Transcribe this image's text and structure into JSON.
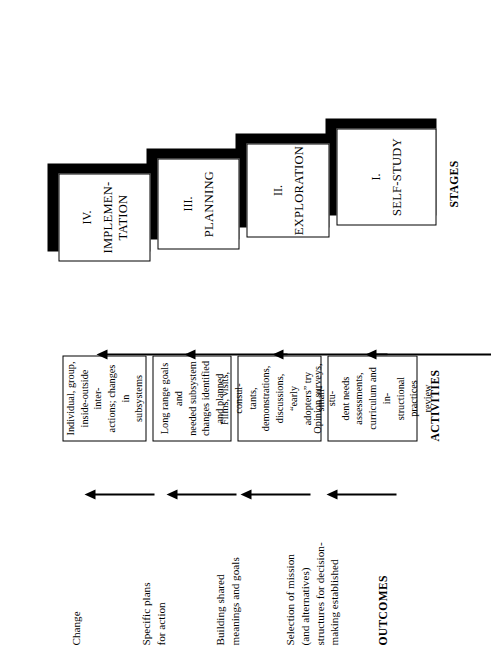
{
  "diagram": {
    "orientation": "rotated-90-ccw",
    "columns": {
      "stages_label": "STAGES",
      "activities_label": "ACTIVITIES",
      "outcomes_label": "OUTCOMES"
    },
    "colors": {
      "ink": "#000000",
      "paper": "#ffffff"
    },
    "rows": [
      {
        "id": "self-study",
        "stage_number": "I.",
        "stage_name": "SELF-STUDY",
        "activities": "Opinion surveys, stu-\ndent needs assessments,\ncurriculum and in-\nstructional practices\nreview",
        "outcome": "Selection of mission\n(and alternatives)\nstructures for decision-\nmaking established"
      },
      {
        "id": "exploration",
        "stage_number": "II.",
        "stage_name": "EXPLORATION",
        "activities": "Films, visits, consul-\ntants, demonstrations,\ndiscussions, “early\nadopters” try small-\nscale innovations",
        "outcome": "Building shared\nmeanings and goals"
      },
      {
        "id": "planning",
        "stage_number": "III.",
        "stage_name": "PLANNING",
        "activities": "Long range goals and\nneeded subsystem\nchanges identified\nand planned",
        "outcome": "Specific plans\nfor action"
      },
      {
        "id": "implementation",
        "stage_number": "IV.",
        "stage_name": "IMPLEMEN-\nTATION",
        "activities": "Individual, group,\ninside-outside inter-\nactions; changes in\nsubsystems",
        "outcome": "Change"
      }
    ]
  }
}
